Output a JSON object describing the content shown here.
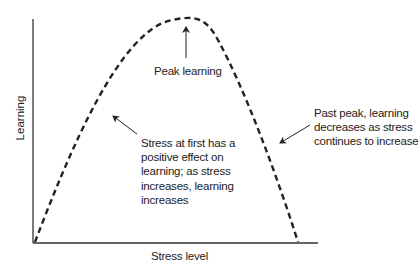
{
  "diagram": {
    "type": "inverted-u-curve",
    "x_axis_label": "Stress level",
    "y_axis_label": "Learning",
    "curve_style": "dashed",
    "annotations": {
      "peak": "Peak learning",
      "left": [
        "Stress at first has a",
        "positive effect on",
        "learning; as stress",
        "increases, learning",
        "increases"
      ],
      "right": [
        "Past peak, learning",
        "decreases as stress",
        "continues to increase"
      ]
    },
    "colors": {
      "line": "#222222",
      "background": "#ffffff"
    }
  }
}
